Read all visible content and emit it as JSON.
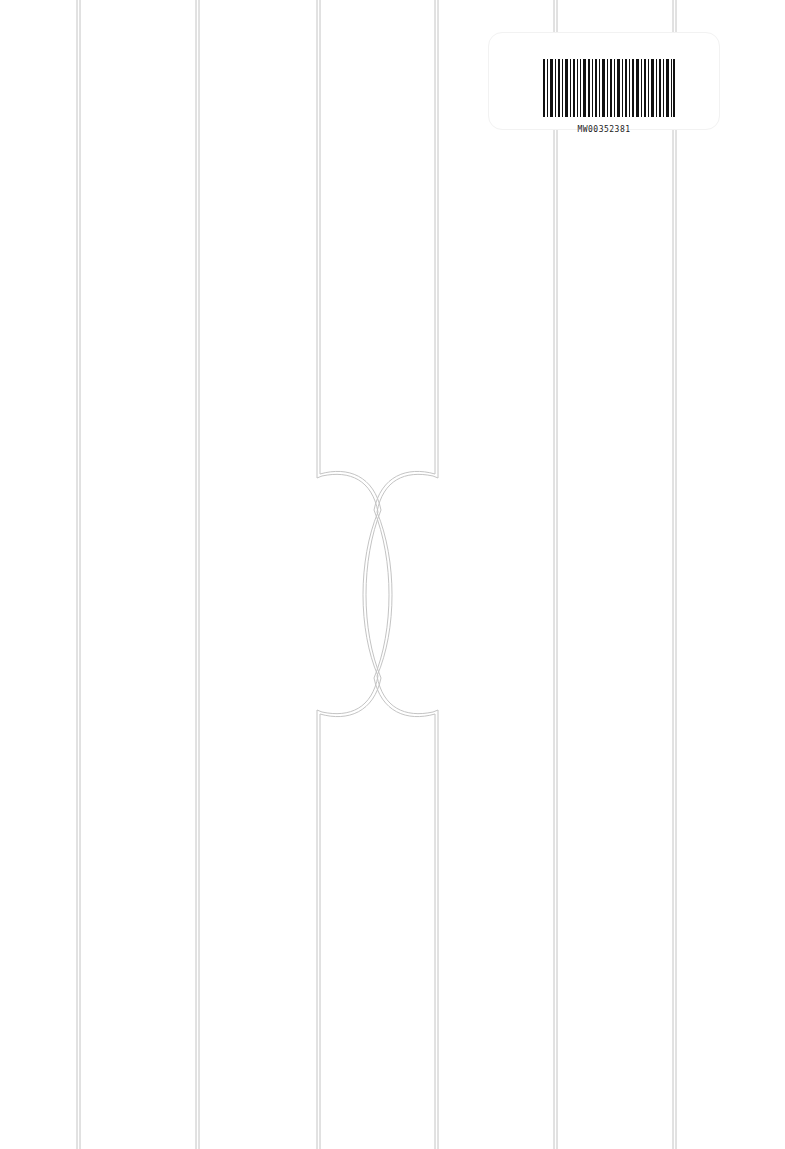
{
  "label": {
    "barcode_text": "MW00352381"
  },
  "colors": {
    "line": "#bdbdbd",
    "background": "#ffffff"
  }
}
